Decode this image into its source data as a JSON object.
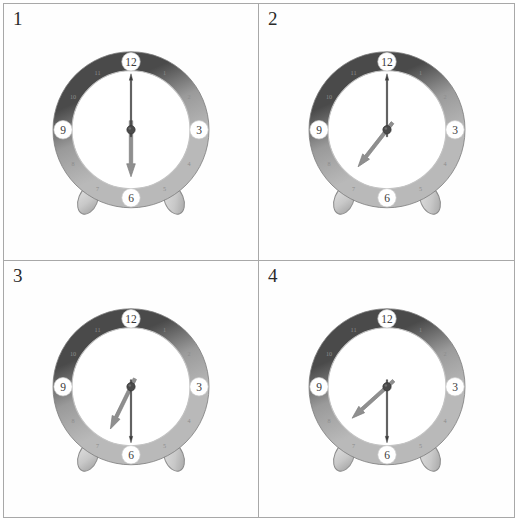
{
  "page": {
    "background": "#ffffff",
    "grid_border_color": "#a8a8a8",
    "rows": 2,
    "columns": 2
  },
  "colors": {
    "bezel_dark": "#4a4a4a",
    "bezel_light": "#b9b9b9",
    "bezel_mid": "#9a9a9a",
    "face": "#ffffff",
    "face_ring": "#c3c3c3",
    "hour_hand": "#8f8f8f",
    "minute_hand": "#3c3c3c",
    "hub": "#4a4a4a",
    "foot": "#c8c8c8",
    "major_label_bg": "#ffffff",
    "major_label_text": "#3a3a3a",
    "minor_label_text": "#8d8d8d"
  },
  "clock_face": {
    "major_numerals": [
      "12",
      "3",
      "6",
      "9"
    ],
    "minor_numerals": [
      "1",
      "2",
      "4",
      "5",
      "7",
      "8",
      "10",
      "11"
    ],
    "all_numerals": [
      "12",
      "1",
      "2",
      "3",
      "4",
      "5",
      "6",
      "7",
      "8",
      "9",
      "10",
      "11"
    ]
  },
  "panels": [
    {
      "index": "1",
      "hour_hand_angle_deg": 180,
      "minute_hand_angle_deg": 0,
      "hour_hand_points_to": "6",
      "minute_hand_points_to": "12",
      "reading": "6:00"
    },
    {
      "index": "2",
      "hour_hand_angle_deg": 218,
      "minute_hand_angle_deg": 0,
      "hour_hand_points_to": "7",
      "minute_hand_points_to": "12",
      "reading": "7:00"
    },
    {
      "index": "3",
      "hour_hand_angle_deg": 206,
      "minute_hand_angle_deg": 180,
      "hour_hand_points_to": "7",
      "minute_hand_points_to": "6",
      "reading": "6:30"
    },
    {
      "index": "4",
      "hour_hand_angle_deg": 228,
      "minute_hand_angle_deg": 180,
      "hour_hand_points_to": "8",
      "minute_hand_points_to": "6",
      "reading": "7:30"
    }
  ]
}
